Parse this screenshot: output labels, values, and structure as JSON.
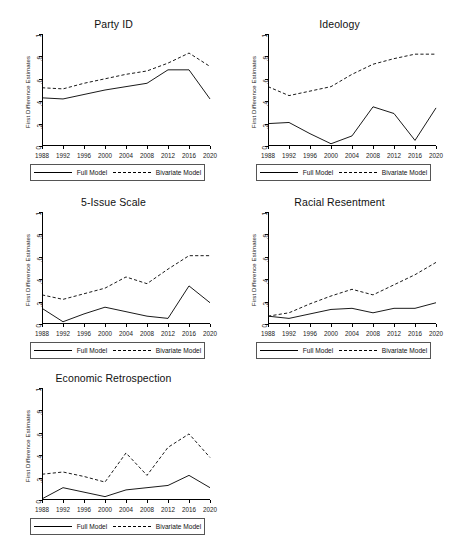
{
  "figure": {
    "legend": {
      "full_model_label": "Full Model",
      "bivariate_model_label": "Bivariate Model"
    },
    "y_axis_label": "First Difference Estimates",
    "y_ticks": [
      "0",
      ".2",
      ".4",
      ".6",
      ".8",
      "1"
    ],
    "x_ticks": [
      "1988",
      "1992",
      "1996",
      "2000",
      "2004",
      "2008",
      "2012",
      "2016",
      "2020"
    ]
  },
  "chart_data": [
    {
      "type": "line",
      "title": "Party ID",
      "xlabel": "",
      "ylabel": "First Difference Estimates",
      "x": [
        1988,
        1992,
        1996,
        2000,
        2004,
        2008,
        2012,
        2016,
        2020
      ],
      "xlim": [
        1988,
        2020
      ],
      "ylim": [
        0,
        1
      ],
      "grid": false,
      "legend_position": "below",
      "series": [
        {
          "name": "Full Model",
          "style": "solid",
          "values": [
            0.43,
            0.42,
            0.46,
            0.5,
            0.53,
            0.56,
            0.68,
            0.68,
            0.42
          ]
        },
        {
          "name": "Bivariate Model",
          "style": "dashed",
          "values": [
            0.52,
            0.51,
            0.56,
            0.6,
            0.64,
            0.67,
            0.74,
            0.83,
            0.71
          ]
        }
      ]
    },
    {
      "type": "line",
      "title": "Ideology",
      "xlabel": "",
      "ylabel": "First Difference Estimates",
      "x": [
        1988,
        1992,
        1996,
        2000,
        2004,
        2008,
        2012,
        2016,
        2020
      ],
      "xlim": [
        1988,
        2020
      ],
      "ylim": [
        0,
        1
      ],
      "grid": false,
      "legend_position": "below",
      "series": [
        {
          "name": "Full Model",
          "style": "solid",
          "values": [
            0.2,
            0.21,
            0.11,
            0.02,
            0.09,
            0.35,
            0.29,
            0.05,
            0.34
          ]
        },
        {
          "name": "Bivariate Model",
          "style": "dashed",
          "values": [
            0.53,
            0.45,
            0.49,
            0.53,
            0.64,
            0.73,
            0.78,
            0.82,
            0.82
          ]
        }
      ]
    },
    {
      "type": "line",
      "title": "5-Issue Scale",
      "xlabel": "",
      "ylabel": "First Difference Estimates",
      "x": [
        1988,
        1992,
        1996,
        2000,
        2004,
        2008,
        2012,
        2016,
        2020
      ],
      "xlim": [
        1988,
        2020
      ],
      "ylim": [
        0,
        1
      ],
      "grid": false,
      "legend_position": "below",
      "series": [
        {
          "name": "Full Model",
          "style": "solid",
          "values": [
            0.14,
            0.02,
            0.09,
            0.15,
            0.11,
            0.07,
            0.05,
            0.34,
            0.19
          ]
        },
        {
          "name": "Bivariate Model",
          "style": "dashed",
          "values": [
            0.26,
            0.22,
            0.27,
            0.32,
            0.42,
            0.36,
            0.49,
            0.61,
            0.61
          ]
        }
      ]
    },
    {
      "type": "line",
      "title": "Racial Resentment",
      "xlabel": "",
      "ylabel": "First Difference Estimates",
      "x": [
        1988,
        1992,
        1996,
        2000,
        2004,
        2008,
        2012,
        2016,
        2020
      ],
      "xlim": [
        1988,
        2020
      ],
      "ylim": [
        0,
        1
      ],
      "grid": false,
      "legend_position": "below",
      "series": [
        {
          "name": "Full Model",
          "style": "solid",
          "values": [
            0.07,
            0.05,
            0.09,
            0.13,
            0.14,
            0.1,
            0.14,
            0.14,
            0.19
          ]
        },
        {
          "name": "Bivariate Model",
          "style": "dashed",
          "values": [
            0.07,
            0.1,
            0.18,
            0.25,
            0.31,
            0.26,
            0.35,
            0.44,
            0.55
          ]
        }
      ]
    },
    {
      "type": "line",
      "title": "Economic Retrospection",
      "xlabel": "",
      "ylabel": "First Difference Estimates",
      "x": [
        1988,
        1992,
        1996,
        2000,
        2004,
        2008,
        2012,
        2016,
        2020
      ],
      "xlim": [
        1988,
        2020
      ],
      "ylim": [
        0,
        1
      ],
      "grid": false,
      "legend_position": "below",
      "series": [
        {
          "name": "Full Model",
          "style": "solid",
          "values": [
            0.01,
            0.11,
            0.07,
            0.03,
            0.09,
            0.11,
            0.13,
            0.22,
            0.11
          ]
        },
        {
          "name": "Bivariate Model",
          "style": "dashed",
          "values": [
            0.23,
            0.25,
            0.21,
            0.16,
            0.42,
            0.22,
            0.47,
            0.59,
            0.38
          ]
        }
      ]
    }
  ]
}
